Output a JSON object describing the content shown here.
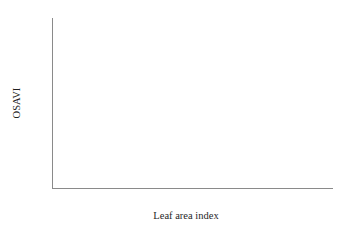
{
  "figure": {
    "background_color": "#ffffff",
    "axis_color": "#8a8a8a",
    "line_color": "#6e6e6e",
    "marker_edge_color": "#5f5f5f",
    "text_color": "#2b2b2b"
  },
  "chart_data": {
    "type": "line",
    "title": "",
    "xlabel": "Leaf area index",
    "ylabel": "OSAVI",
    "xlim": [
      0,
      4.5
    ],
    "ylim": [
      0,
      0.8
    ],
    "grid": false,
    "legend": "none",
    "x_ticks": [
      0,
      1,
      2,
      3,
      4
    ],
    "x_tick_labels": [
      "0",
      "1",
      "2",
      "3",
      "4"
    ],
    "x_minor_ticks": [
      0.5,
      1.5,
      2.5,
      3.5
    ],
    "y_ticks": [
      0,
      0.1,
      0.2,
      0.3,
      0.4,
      0.5,
      0.6,
      0.7,
      0.8
    ],
    "y_tick_labels": [
      "0",
      "0.1",
      "0.2",
      "0.3",
      "0.4",
      "0.5",
      "0.6",
      "0.7",
      "0.8"
    ],
    "x": [
      0,
      0.5,
      1,
      1.5,
      2,
      2.5,
      3,
      3.5,
      4
    ],
    "series": [
      {
        "name": "series-1",
        "marker": "square",
        "values": [
          0.055,
          0.335,
          0.51,
          0.6,
          0.651,
          0.684,
          0.7,
          0.711,
          0.716
        ]
      },
      {
        "name": "series-2",
        "marker": "circle",
        "values": [
          0.055,
          0.3,
          0.455,
          0.565,
          0.62,
          0.658,
          0.681,
          0.694,
          0.702
        ]
      },
      {
        "name": "series-3",
        "marker": "triangle",
        "values": [
          0.055,
          0.245,
          0.39,
          0.495,
          0.565,
          0.61,
          0.644,
          0.665,
          0.682
        ]
      },
      {
        "name": "series-4",
        "marker": "plus",
        "values": [
          0.055,
          0.21,
          0.335,
          0.43,
          0.51,
          0.565,
          0.604,
          0.634,
          0.653
        ]
      }
    ]
  }
}
